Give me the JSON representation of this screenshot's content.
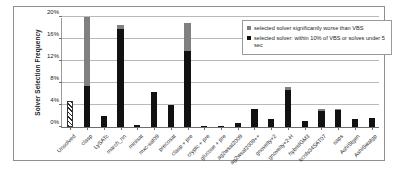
{
  "chart_data": {
    "type": "bar",
    "title": "",
    "xlabel": "",
    "ylabel": "Solver Selection Frequency",
    "ylim": [
      0,
      20
    ],
    "yticks": [
      "0%",
      "4%",
      "8%",
      "12%",
      "16%",
      "20%"
    ],
    "ytick_values": [
      0,
      4,
      8,
      12,
      16,
      20
    ],
    "grid": true,
    "stacked": true,
    "legend_position": "top-right",
    "units": "percent",
    "categories": [
      "Unsolved",
      "clasp",
      "LySATc",
      "march_nn",
      "minisat",
      "mxc-sat09",
      "precosat",
      "clasp + pre",
      "cryptc + pre",
      "glucose + pre",
      "ag2wsat2009",
      "ag2wsat2009++",
      "gnovelty+2",
      "gnovelty+2-H",
      "hybridGM3",
      "kcnfs04SAT07",
      "saps",
      "AshiStgen",
      "AshiSwatgp"
    ],
    "series": [
      {
        "name": "selected solver: within 10% of VBS or solves under 5 sec",
        "color": "#111111",
        "values": [
          0,
          7.5,
          2.0,
          17.9,
          0.3,
          6.3,
          4.0,
          13.8,
          0.2,
          0.25,
          0.75,
          3.3,
          1.5,
          6.7,
          1.1,
          3.0,
          3.1,
          1.5,
          1.7
        ]
      },
      {
        "name": "selected solver significantly worse than VBS",
        "color": "#808080",
        "values": [
          0,
          12.5,
          0,
          0.7,
          0,
          0,
          0,
          5.2,
          0,
          0,
          0,
          0,
          0,
          0.6,
          0,
          0.3,
          0.2,
          0,
          0
        ]
      }
    ],
    "special_bars": [
      {
        "category": "Unsolved",
        "style": "hatched",
        "value": 4.7
      }
    ],
    "legend": [
      {
        "swatch": "gray",
        "label": "selected solver significantly worse than VBS"
      },
      {
        "swatch": "black",
        "label": "selected solver: within 10% of VBS or solves under 5 sec"
      }
    ]
  }
}
